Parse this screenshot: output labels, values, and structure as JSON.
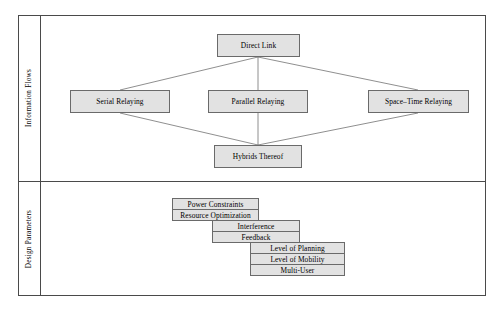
{
  "diagram": {
    "type": "hierarchy-diagram",
    "box_fill": "#e2e2e2",
    "box_border": "#6a6a6a",
    "frame_border": "#4a4a4a",
    "sections": [
      {
        "id": "information-flows",
        "label": "Information Flows",
        "nodes": [
          {
            "id": "direct-link",
            "label": "Direct Link",
            "level": "top"
          },
          {
            "id": "serial-relaying",
            "label": "Serial Relaying",
            "level": "middle"
          },
          {
            "id": "parallel-relaying",
            "label": "Parallel Relaying",
            "level": "middle"
          },
          {
            "id": "space-time-relaying",
            "label": "Space–Time Relaying",
            "level": "middle"
          },
          {
            "id": "hybrids-thereof",
            "label": "Hybrids Thereof",
            "level": "bottom"
          }
        ],
        "edges": [
          {
            "from": "direct-link",
            "to": "serial-relaying"
          },
          {
            "from": "direct-link",
            "to": "parallel-relaying"
          },
          {
            "from": "direct-link",
            "to": "space-time-relaying"
          },
          {
            "from": "serial-relaying",
            "to": "hybrids-thereof"
          },
          {
            "from": "parallel-relaying",
            "to": "hybrids-thereof"
          },
          {
            "from": "space-time-relaying",
            "to": "hybrids-thereof"
          }
        ]
      },
      {
        "id": "design-parameters",
        "label": "Design Parameters",
        "nodes": [
          {
            "id": "power-constraints",
            "label": "Power Constraints",
            "group": 1
          },
          {
            "id": "resource-optimization",
            "label": "Resource Optimization",
            "group": 1
          },
          {
            "id": "interference",
            "label": "Interference",
            "group": 2
          },
          {
            "id": "feedback",
            "label": "Feedback",
            "group": 2
          },
          {
            "id": "level-of-planning",
            "label": "Level of Planning",
            "group": 3
          },
          {
            "id": "level-of-mobility",
            "label": "Level of Mobility",
            "group": 3
          },
          {
            "id": "multi-user",
            "label": "Multi-User",
            "group": 3
          }
        ]
      }
    ]
  }
}
